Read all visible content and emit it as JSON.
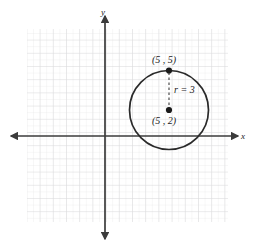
{
  "figure": {
    "background_color": "#ffffff",
    "grid": {
      "minor_color": "#ececed",
      "major_color": "#dedee0",
      "left_px": 27,
      "top_px": 29,
      "right_px": 228,
      "bottom_px": 222,
      "minor_step_px": 6.6,
      "major_step_px": 13.2
    },
    "axes": {
      "color": "#3b3b3b",
      "x_label": "x",
      "y_label": "y",
      "origin_x_px": 105,
      "origin_y_px": 136,
      "x_start_px": 11,
      "x_end_px": 238,
      "y_start_px": 16,
      "y_end_px": 239
    },
    "circle": {
      "stroke_color": "#2a2a2a",
      "center_label": "(5 , 2)",
      "top_point_label": "(5 , 5)",
      "radius_label": "r = 3",
      "center_x_units": 5,
      "center_y_units": 2,
      "radius_units": 3,
      "center_x_px": 169,
      "center_y_px": 110,
      "radius_px": 39.5,
      "top_point_x_px": 169,
      "top_point_y_px": 70.5
    },
    "radius_line": {
      "style": "dashed",
      "color": "#3b3b3b"
    },
    "labels": {
      "top_point": {
        "text": "(5 , 5)",
        "x_px": 152,
        "y_px": 55
      },
      "center_point": {
        "text": "(5 , 2)",
        "x_px": 152,
        "y_px": 116
      },
      "radius": {
        "text": "r = 3",
        "x_px": 174,
        "y_px": 85
      },
      "y_axis": {
        "text": "y",
        "x_px": 101,
        "y_px": 8
      },
      "x_axis": {
        "text": "x",
        "x_px": 241,
        "y_px": 132
      }
    }
  }
}
